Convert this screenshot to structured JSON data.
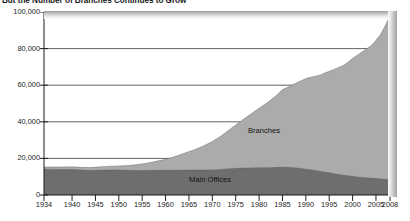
{
  "chart_data": {
    "type": "area",
    "stacked": true,
    "title": "But the Number of Branches Continues to Grow",
    "xlabel": "",
    "ylabel": "",
    "xlim": [
      1934,
      2008
    ],
    "ylim": [
      0,
      100000
    ],
    "grid": true,
    "legend_position": "inline-annotations",
    "y_ticks": [
      0,
      20000,
      40000,
      60000,
      80000,
      100000
    ],
    "y_tick_labels": [
      "0",
      "20,000",
      "40,000",
      "60,000",
      "80,000",
      "100,000"
    ],
    "x_ticks": [
      1934,
      1940,
      1945,
      1950,
      1955,
      1960,
      1965,
      1970,
      1975,
      1980,
      1985,
      1990,
      1995,
      2000,
      2005,
      2008
    ],
    "x_tick_labels": [
      "1934",
      "1940",
      "1945",
      "1950",
      "1955",
      "1960",
      "1965",
      "1970",
      "1975",
      "1980",
      "1985",
      "1990",
      "1995",
      "2000",
      "2005",
      "2008"
    ],
    "annotations": [
      {
        "name": "branches-label",
        "text": "Branches"
      },
      {
        "name": "main-offices-label",
        "text": "Main Offices"
      }
    ],
    "colors": {
      "main_offices": "#6e6e6e",
      "branches": "#ababab",
      "axis": "#1c1c1c",
      "grid": "#3c3c3c",
      "background": "#ffffff"
    },
    "x": [
      1934,
      1936,
      1938,
      1940,
      1942,
      1944,
      1946,
      1948,
      1950,
      1952,
      1954,
      1956,
      1958,
      1960,
      1962,
      1964,
      1966,
      1968,
      1970,
      1972,
      1974,
      1976,
      1978,
      1980,
      1982,
      1984,
      1985,
      1986,
      1987,
      1988,
      1989,
      1990,
      1991,
      1992,
      1993,
      1994,
      1995,
      1996,
      1997,
      1998,
      1999,
      2000,
      2001,
      2002,
      2003,
      2004,
      2005,
      2006,
      2007,
      2008
    ],
    "series": [
      {
        "name": "Main Offices",
        "values": [
          14100,
          14000,
          13900,
          13900,
          13600,
          13400,
          13600,
          13700,
          13700,
          13500,
          13400,
          13400,
          13500,
          13500,
          13500,
          13600,
          13600,
          13700,
          13700,
          14000,
          14400,
          14700,
          14800,
          14900,
          14900,
          15100,
          15100,
          15200,
          15000,
          14800,
          14500,
          14100,
          13800,
          13400,
          13000,
          12600,
          12100,
          11600,
          11200,
          10800,
          10500,
          10200,
          9900,
          9600,
          9400,
          9200,
          9000,
          8800,
          8600,
          8400
        ],
        "color": "#6e6e6e"
      },
      {
        "name": "Branches",
        "values": [
          1200,
          1300,
          1400,
          1500,
          1500,
          1600,
          1800,
          2000,
          2200,
          2600,
          3200,
          4000,
          4900,
          6000,
          7500,
          9200,
          11000,
          13000,
          15500,
          18500,
          22000,
          25500,
          29000,
          32500,
          36000,
          40000,
          42500,
          43500,
          45000,
          46500,
          48000,
          49500,
          50500,
          51500,
          52500,
          54000,
          55500,
          57000,
          58500,
          60000,
          62000,
          64500,
          66500,
          68500,
          70500,
          72500,
          75500,
          79000,
          84000,
          89500
        ],
        "color": "#ababab"
      }
    ]
  }
}
